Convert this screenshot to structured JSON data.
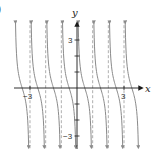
{
  "panel_label": ")",
  "chart_data": {
    "type": "line",
    "title": "",
    "function": "y = cot(pi x)",
    "xlabel": "x",
    "ylabel": "y",
    "xlim": [
      -4,
      4.1
    ],
    "ylim": [
      -3.7,
      4.1
    ],
    "grid": false,
    "legend": null,
    "x_tick_labels": [
      {
        "value": -3,
        "label": "-3"
      },
      {
        "value": 3,
        "label": "3"
      }
    ],
    "y_tick_labels": [
      {
        "value": 3,
        "label": "3"
      },
      {
        "value": -3,
        "label": "-3"
      }
    ],
    "y_ticks": [
      -3,
      -2,
      -1,
      1,
      2,
      3
    ],
    "vertical_asymptotes": [
      -3,
      -2,
      -1,
      0,
      1,
      2,
      3
    ],
    "asymptote_style": "dashed",
    "branches": [
      {
        "interval": [
          -4,
          -3
        ]
      },
      {
        "interval": [
          -3,
          -2
        ]
      },
      {
        "interval": [
          -2,
          -1
        ]
      },
      {
        "interval": [
          -1,
          0
        ]
      },
      {
        "interval": [
          0,
          1
        ]
      },
      {
        "interval": [
          1,
          2
        ]
      },
      {
        "interval": [
          2,
          3
        ]
      },
      {
        "interval": [
          3,
          4
        ]
      }
    ],
    "colors": {
      "curve": "#8a8a8a",
      "asymptote": "#9a9a9a",
      "axis": "#1a1a1a"
    }
  },
  "axes": {
    "x_label": "x",
    "y_label": "y",
    "x_tick_neg": "−3",
    "x_tick_pos": "3",
    "y_tick_pos": "3",
    "y_tick_neg": "−3"
  }
}
